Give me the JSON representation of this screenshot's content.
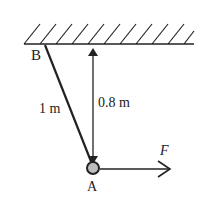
{
  "diagram": {
    "labels": {
      "point_b": "B",
      "point_a": "A",
      "rope_length": "1 m",
      "height": "0.8 m",
      "force": "F"
    },
    "colors": {
      "ink": "#222222",
      "ball_fill": "#bdbdbd"
    }
  }
}
